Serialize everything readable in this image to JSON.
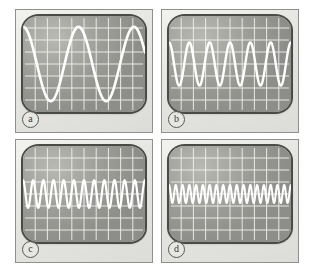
{
  "figure": {
    "background_color": "#ffffff",
    "panel_background_color": "#e9e9e6",
    "screen_color": "#9a9a96",
    "trace_color": "#ffffff",
    "graticule_color": "#f0f0ec",
    "columns": 2,
    "rows": 2
  },
  "panels": [
    {
      "id": "a",
      "label": "a",
      "graticule": {
        "x_divisions": 10,
        "y_divisions": 8
      },
      "waveform": {
        "type": "sine",
        "cycles_on_screen": 2.2,
        "amplitude_divisions_peak_to_peak": 6.2,
        "phase_degrees": 90,
        "trace_width_px": 2.6,
        "vertical_center_division": 4
      }
    },
    {
      "id": "b",
      "label": "b",
      "graticule": {
        "x_divisions": 10,
        "y_divisions": 8
      },
      "waveform": {
        "type": "sine",
        "cycles_on_screen": 6.0,
        "amplitude_divisions_peak_to_peak": 3.6,
        "phase_degrees": 90,
        "trace_width_px": 2.4,
        "vertical_center_division": 4
      }
    },
    {
      "id": "c",
      "label": "c",
      "graticule": {
        "x_divisions": 10,
        "y_divisions": 8
      },
      "waveform": {
        "type": "sine",
        "cycles_on_screen": 12.0,
        "amplitude_divisions_peak_to_peak": 2.3,
        "phase_degrees": 90,
        "trace_width_px": 2.2,
        "vertical_center_division": 4
      }
    },
    {
      "id": "d",
      "label": "d",
      "graticule": {
        "x_divisions": 10,
        "y_divisions": 8
      },
      "waveform": {
        "type": "sine",
        "cycles_on_screen": 18.0,
        "amplitude_divisions_peak_to_peak": 1.5,
        "phase_degrees": 90,
        "trace_width_px": 2.0,
        "vertical_center_division": 4
      }
    }
  ],
  "chart_data": {
    "type": "line",
    "subtitle": "",
    "xlabel": "",
    "ylabel": "",
    "grid": true,
    "legend_position": "none",
    "x": [
      0,
      10
    ],
    "xlim": [
      0,
      10
    ],
    "ylim": [
      0,
      8
    ],
    "x_axis_units": "screen divisions",
    "y_axis_units": "screen divisions",
    "annotations": [
      "a",
      "b",
      "c",
      "d"
    ],
    "series": [
      {
        "name": "a",
        "function": "sine",
        "cycles": 2.2,
        "amplitude_pp_div": 6.2,
        "offset_div": 4
      },
      {
        "name": "b",
        "function": "sine",
        "cycles": 6.0,
        "amplitude_pp_div": 3.6,
        "offset_div": 4
      },
      {
        "name": "c",
        "function": "sine",
        "cycles": 12.0,
        "amplitude_pp_div": 2.3,
        "offset_div": 4
      },
      {
        "name": "d",
        "function": "sine",
        "cycles": 18.0,
        "amplitude_pp_div": 1.5,
        "offset_div": 4
      }
    ]
  }
}
